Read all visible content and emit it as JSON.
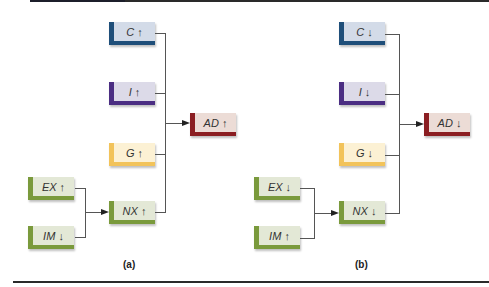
{
  "colors": {
    "consumption": {
      "accent": "#1f4f7a",
      "fill": "#d3dbe8"
    },
    "investment": {
      "accent": "#4b2e83",
      "fill": "#dcdae8"
    },
    "government": {
      "accent": "#f2c35a",
      "fill": "#fcf1d4"
    },
    "net_exports": {
      "accent": "#7a9a3c",
      "fill": "#e3e8d6"
    },
    "aggregate_demand": {
      "accent": "#8b1e22",
      "fill": "#ecdcd6"
    },
    "connector": "#555555"
  },
  "panels": [
    {
      "label": "(a)",
      "boxes": {
        "C": "C ↑",
        "I": "I ↑",
        "G": "G ↑",
        "EX": "EX ↑",
        "IM": "IM ↓",
        "NX": "NX ↑",
        "AD": "AD ↑"
      }
    },
    {
      "label": "(b)",
      "boxes": {
        "C": "C ↓",
        "I": "I ↓",
        "G": "G ↓",
        "EX": "EX ↓",
        "IM": "IM ↑",
        "NX": "NX ↓",
        "AD": "AD ↓"
      }
    }
  ]
}
